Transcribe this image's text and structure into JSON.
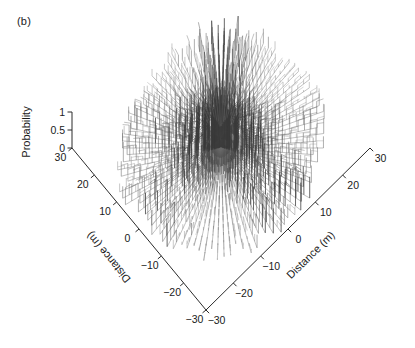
{
  "panel": {
    "label": "(b)"
  },
  "axes": {
    "z": {
      "title": "Probability",
      "ticks": [
        "1",
        "0.5",
        "0"
      ],
      "range": [
        0,
        1
      ]
    },
    "left": {
      "title": "Distance (m)",
      "ticks": [
        "-30",
        "-20",
        "-10",
        "0",
        "10",
        "20",
        "30"
      ],
      "ticks_display": [
        "−30",
        "−20",
        "−10",
        "0",
        "10",
        "20",
        "30"
      ],
      "range": [
        -30,
        30
      ],
      "unit": "m"
    },
    "right": {
      "title": "Distance (m)",
      "ticks": [
        "-30",
        "-20",
        "-10",
        "0",
        "10",
        "20",
        "30"
      ],
      "ticks_display": [
        "−30",
        "−20",
        "−10",
        "0",
        "10",
        "20",
        "30"
      ],
      "range": [
        -30,
        30
      ],
      "unit": "m"
    }
  },
  "colors": {
    "background": "#ffffff",
    "axis": "#2b2b2b",
    "text": "#1a1a1a",
    "stem_dark": "#3a3a3a",
    "stem_mid": "#6a6a6a",
    "stem_light": "#9a9a9a"
  },
  "chart_data": {
    "type": "scatter",
    "title": "",
    "subtitle": "",
    "xlabel": "Distance (m)",
    "ylabel": "Distance (m)",
    "zlabel": "Probability",
    "xlim": [
      -30,
      30
    ],
    "ylim": [
      -30,
      30
    ],
    "zlim": [
      0,
      1
    ],
    "grid": false,
    "legend": null,
    "projection": "3d-stem-radial",
    "n_rays": 96,
    "samples_per_ray": 14,
    "radius_max": 30,
    "seed": 20240817,
    "z_center_peak": 1.0,
    "z_outer_typical": 0.45,
    "annotations": []
  }
}
